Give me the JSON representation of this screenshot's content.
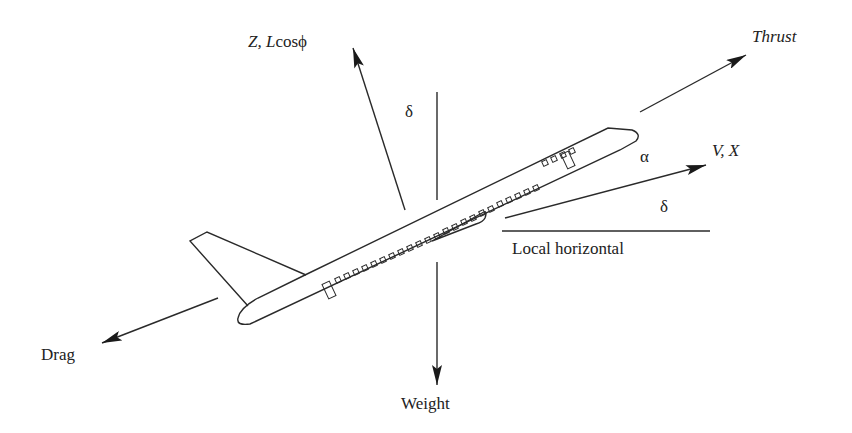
{
  "diagram": {
    "type": "free-body force diagram",
    "labels": {
      "z_lift": {
        "z": "Z,",
        "l": "L",
        "cos": "cosϕ"
      },
      "thrust": "Thrust",
      "velocity": "V, X",
      "alpha": "α",
      "delta_top": "δ",
      "delta_right": "δ",
      "local_horizontal": "Local horizontal",
      "drag": "Drag",
      "weight": "Weight"
    },
    "forces": [
      {
        "name": "Z, L cosϕ",
        "direction": "up-left, perpendicular to flight path"
      },
      {
        "name": "Thrust",
        "direction": "along fuselage axis, forward-up"
      },
      {
        "name": "V, X",
        "direction": "flight path"
      },
      {
        "name": "Drag",
        "direction": "rearward, opposite flight path"
      },
      {
        "name": "Weight",
        "direction": "vertically down"
      }
    ],
    "angles": [
      {
        "symbol": "α",
        "between": "fuselage axis and velocity"
      },
      {
        "symbol": "δ",
        "between": "velocity and local horizontal"
      },
      {
        "symbol": "δ",
        "between": "Z axis and vertical"
      }
    ],
    "colors": {
      "stroke": "#2a2a2a",
      "background": "#ffffff"
    }
  }
}
